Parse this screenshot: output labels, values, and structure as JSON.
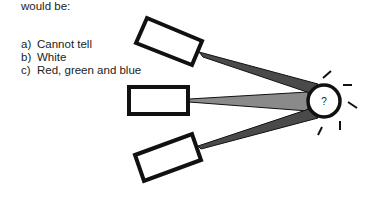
{
  "question": {
    "intro": "would be:",
    "options": [
      {
        "letter": "a)",
        "text": "Cannot tell"
      },
      {
        "letter": "b)",
        "text": "White"
      },
      {
        "letter": "c)",
        "text": "Red, green and blue"
      }
    ]
  },
  "diagram": {
    "spot_label": "?",
    "colors": {
      "stroke": "#111111",
      "beam_dark": "#4a4a4a",
      "beam_mid": "#8a8a8a",
      "background": "#ffffff"
    }
  }
}
